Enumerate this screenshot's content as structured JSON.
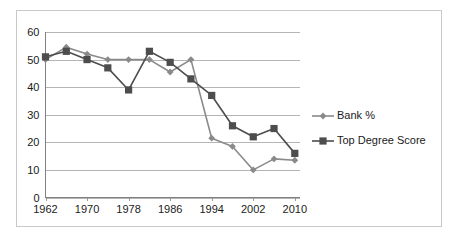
{
  "chart_data": {
    "type": "line",
    "title": "",
    "subtitle": "",
    "xlabel": "",
    "ylabel": "",
    "xlim": [
      1962,
      2011
    ],
    "ylim": [
      0,
      60
    ],
    "grid": true,
    "grid_axis": "y",
    "legend_position": "right",
    "y_ticks": [
      "0",
      "10",
      "20",
      "30",
      "40",
      "50",
      "60"
    ],
    "y_tick_values": [
      0,
      10,
      20,
      30,
      40,
      50,
      60
    ],
    "x_ticks": [
      "1962",
      "1970",
      "1978",
      "1986",
      "1994",
      "2002",
      "2010"
    ],
    "x_tick_values": [
      1962,
      1970,
      1978,
      1986,
      1994,
      2002,
      2010
    ],
    "x": [
      1962,
      1966,
      1970,
      1974,
      1978,
      1982,
      1986,
      1990,
      1994,
      1998,
      2002,
      2006,
      2010
    ],
    "series": [
      {
        "name": "Bank %",
        "marker": "diamond",
        "color": "#8a8a8a",
        "values": [
          50,
          54.5,
          52,
          50,
          50,
          50,
          45.5,
          50,
          21.5,
          18.5,
          10,
          14,
          13.5
        ]
      },
      {
        "name": "Top Degree Score",
        "marker": "square",
        "color": "#4d4d4d",
        "values": [
          51,
          53,
          50,
          47,
          39,
          53,
          49,
          43,
          37,
          26,
          22,
          25,
          16
        ]
      }
    ]
  },
  "legend": {
    "entries": [
      {
        "label": "Bank %",
        "marker": "diamond-marker",
        "color": "#8a8a8a"
      },
      {
        "label": "Top Degree Score",
        "marker": "square-marker",
        "color": "#4d4d4d"
      }
    ]
  },
  "colors": {
    "background": "#ffffff",
    "frame": "#c9c9c9",
    "gridline": "#b5b5b5",
    "axis": "#808080",
    "text": "#1a1a1a",
    "series_bank": "#8a8a8a",
    "series_top_degree": "#4d4d4d"
  }
}
